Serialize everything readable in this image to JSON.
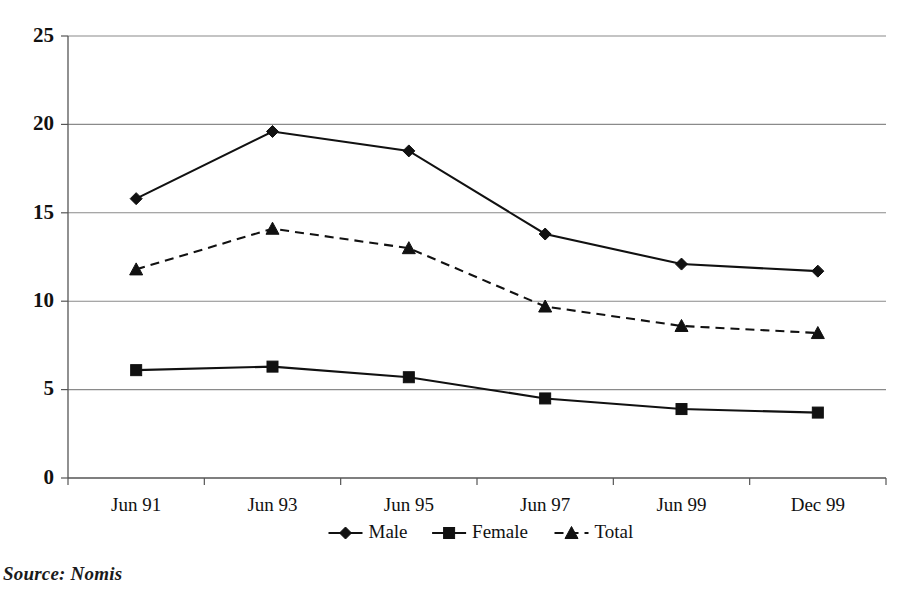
{
  "source_note": "Source: Nomis",
  "chart_data": {
    "type": "line",
    "title": "",
    "subtitle": "",
    "xlabel": "",
    "ylabel": "",
    "categories": [
      "Jun 91",
      "Jun 93",
      "Jun 95",
      "Jun 97",
      "Jun 99",
      "Dec 99"
    ],
    "ylim": [
      0,
      25
    ],
    "yticks": [
      0,
      5,
      10,
      15,
      20,
      25
    ],
    "ytick_labels": [
      "0",
      "5",
      "10",
      "15",
      "20",
      "25"
    ],
    "grid": "horizontal",
    "legend_position": "bottom",
    "series": [
      {
        "name": "Male",
        "marker": "diamond",
        "linestyle": "solid",
        "color": "#111111",
        "values": [
          15.8,
          19.6,
          18.5,
          13.8,
          12.1,
          11.7
        ]
      },
      {
        "name": "Female",
        "marker": "square",
        "linestyle": "solid",
        "color": "#111111",
        "values": [
          6.1,
          6.3,
          5.7,
          4.5,
          3.9,
          3.7
        ]
      },
      {
        "name": "Total",
        "marker": "triangle",
        "linestyle": "dashed",
        "color": "#111111",
        "values": [
          11.8,
          14.1,
          13.0,
          9.7,
          8.6,
          8.2
        ]
      }
    ]
  }
}
